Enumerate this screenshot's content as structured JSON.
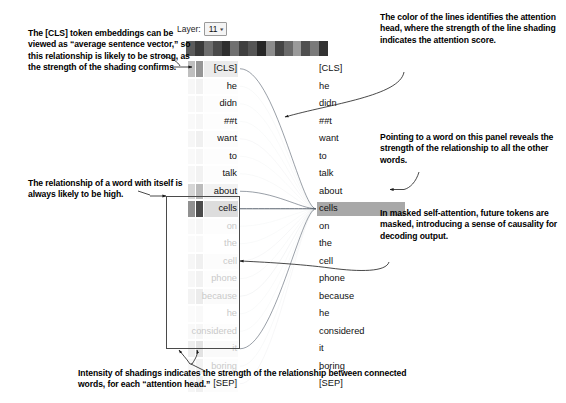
{
  "controls": {
    "layer_label": "Layer:",
    "layer_value": "11",
    "caret_icon": "chevron-down-icon"
  },
  "head_selector": {
    "name": "attention-head-color-bar",
    "swatches": [
      "#5b5b5b",
      "#3a3a3a",
      "#6e6e6e",
      "#4a4a4a",
      "#2f2f2f",
      "#707070",
      "#3f3f3f",
      "#555555",
      "#262626",
      "#8c8c8c",
      "#444444",
      "#6a6a6a",
      "#9a9a9a",
      "#4f4f4f",
      "#7a7a7a",
      "#333333"
    ]
  },
  "tokens": {
    "left": [
      {
        "text": "[CLS]",
        "masked": false
      },
      {
        "text": "he",
        "masked": false
      },
      {
        "text": "didn",
        "masked": false
      },
      {
        "text": "##t",
        "masked": false
      },
      {
        "text": "want",
        "masked": false
      },
      {
        "text": "to",
        "masked": false
      },
      {
        "text": "talk",
        "masked": false
      },
      {
        "text": "about",
        "masked": false
      },
      {
        "text": "cells",
        "masked": false
      },
      {
        "text": "on",
        "masked": true
      },
      {
        "text": "the",
        "masked": true
      },
      {
        "text": "cell",
        "masked": true
      },
      {
        "text": "phone",
        "masked": true
      },
      {
        "text": "because",
        "masked": true
      },
      {
        "text": "he",
        "masked": true
      },
      {
        "text": "considered",
        "masked": true
      },
      {
        "text": "it",
        "masked": true
      },
      {
        "text": "boring",
        "masked": true
      },
      {
        "text": "[SEP]",
        "masked": false
      }
    ],
    "right": [
      {
        "text": "[CLS]",
        "selected": false
      },
      {
        "text": "he",
        "selected": false
      },
      {
        "text": "didn",
        "selected": false
      },
      {
        "text": "##t",
        "selected": false
      },
      {
        "text": "want",
        "selected": false
      },
      {
        "text": "to",
        "selected": false
      },
      {
        "text": "talk",
        "selected": false
      },
      {
        "text": "about",
        "selected": false
      },
      {
        "text": "cells",
        "selected": true
      },
      {
        "text": "on",
        "selected": false
      },
      {
        "text": "the",
        "selected": false
      },
      {
        "text": "cell",
        "selected": false
      },
      {
        "text": "phone",
        "selected": false
      },
      {
        "text": "because",
        "selected": false
      },
      {
        "text": "he",
        "selected": false
      },
      {
        "text": "considered",
        "selected": false
      },
      {
        "text": "it",
        "selected": false
      },
      {
        "text": "boring",
        "selected": false
      },
      {
        "text": "[SEP]",
        "selected": false
      }
    ]
  },
  "annotations": {
    "cls": "The [CLS] token embeddings can be viewed as “average sentence vector,” so this relationship is likely to be strong, as the strength of the shading confirms.",
    "self": "The relationship of a word with itself is always likely to be high.",
    "color": "The color of the lines identifies the attention head, where the strength of the line shading indicates the attention score.",
    "point": "Pointing to a word on this panel reveals the strength of the relationship to all the other words.",
    "mask": "In masked self-attention, future tokens are masked, introducing a sense of causality for decoding output.",
    "intensity": "Intensity of shadings indicates the strength of the relationship between connected words, for each “attention head.”"
  },
  "chart_data": {
    "type": "heatmap",
    "selected_token": "cells",
    "selected_index": 8,
    "layer": 11,
    "num_heads": 16,
    "categories": [
      "[CLS]",
      "he",
      "didn",
      "##t",
      "want",
      "to",
      "talk",
      "about",
      "cells",
      "on",
      "the",
      "cell",
      "phone",
      "because",
      "he",
      "considered",
      "it",
      "boring",
      "[SEP]"
    ],
    "series": [
      {
        "name": "attention from “cells”",
        "values": [
          0.34,
          0.04,
          0.03,
          0.03,
          0.05,
          0.03,
          0.04,
          0.22,
          0.58,
          0.03,
          0.02,
          0.05,
          0.04,
          0.06,
          0.02,
          0.03,
          0.09,
          0.04,
          0.05
        ]
      }
    ],
    "xlabel": "source token",
    "ylabel": "attention weight",
    "grid": false,
    "legend": "none"
  }
}
